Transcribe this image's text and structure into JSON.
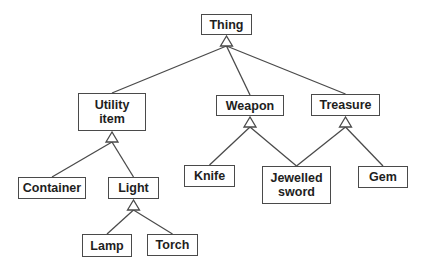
{
  "diagram": {
    "type": "class-hierarchy",
    "colors": {
      "background": "#ffffff",
      "line": "#4a4a4a",
      "text": "#1e1e1e"
    },
    "nodes": [
      {
        "id": "thing",
        "label": "Thing",
        "x": 201,
        "y": 14,
        "w": 51,
        "h": 21
      },
      {
        "id": "utility_item",
        "label": "Utility\nitem",
        "x": 78,
        "y": 93,
        "w": 68,
        "h": 38
      },
      {
        "id": "weapon",
        "label": "Weapon",
        "x": 216,
        "y": 95,
        "w": 68,
        "h": 21
      },
      {
        "id": "treasure",
        "label": "Treasure",
        "x": 311,
        "y": 94,
        "w": 69,
        "h": 22
      },
      {
        "id": "container",
        "label": "Container",
        "x": 18,
        "y": 177,
        "w": 68,
        "h": 22
      },
      {
        "id": "light",
        "label": "Light",
        "x": 108,
        "y": 177,
        "w": 51,
        "h": 22
      },
      {
        "id": "knife",
        "label": "Knife",
        "x": 184,
        "y": 165,
        "w": 51,
        "h": 22
      },
      {
        "id": "jewelled_sword",
        "label": "Jewelled\nsword",
        "x": 262,
        "y": 166,
        "w": 69,
        "h": 38
      },
      {
        "id": "gem",
        "label": "Gem",
        "x": 358,
        "y": 166,
        "w": 50,
        "h": 22
      },
      {
        "id": "lamp",
        "label": "Lamp",
        "x": 82,
        "y": 234,
        "w": 50,
        "h": 23
      },
      {
        "id": "torch",
        "label": "Torch",
        "x": 147,
        "y": 234,
        "w": 51,
        "h": 22
      }
    ],
    "generalizations": [
      {
        "parent": "thing",
        "children": [
          "utility_item",
          "weapon",
          "treasure"
        ]
      },
      {
        "parent": "utility_item",
        "children": [
          "container",
          "light"
        ]
      },
      {
        "parent": "weapon",
        "children": [
          "knife",
          "jewelled_sword"
        ]
      },
      {
        "parent": "treasure",
        "children": [
          "jewelled_sword",
          "gem"
        ]
      },
      {
        "parent": "light",
        "children": [
          "lamp",
          "torch"
        ]
      }
    ]
  }
}
